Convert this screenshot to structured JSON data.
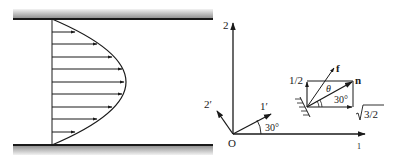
{
  "left_panel": {
    "description": "Parabolic velocity profile between two parallel walls",
    "arrow_count": 9
  },
  "right_panel": {
    "axes": {
      "origin": "O",
      "axis_2": "2",
      "axis_1": "1",
      "axis_1_prime": "1′",
      "axis_2_prime": "2′",
      "rotation_angle": "30°"
    },
    "inset": {
      "force_label": "f",
      "normal_label": "n",
      "theta_label": "θ",
      "angle_label": "30°",
      "vertical_component": "1/2",
      "horizontal_component": "√3/2",
      "horizontal_component_radicand": "3/2"
    }
  },
  "colors": {
    "line": "#1a1a1a",
    "wall_band_dark": "#8a8a8a",
    "wall_band_light": "#e6e6e6"
  }
}
